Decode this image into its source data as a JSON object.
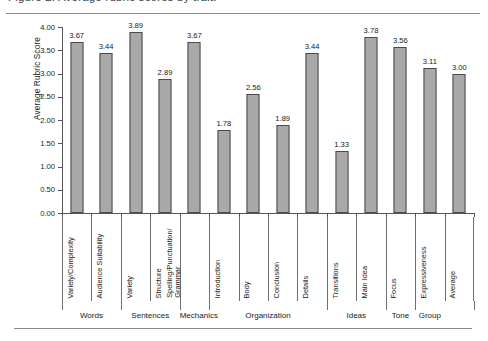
{
  "caption": {
    "text": "Figure 2. Average rubric scores by trait."
  },
  "chart_data": {
    "type": "bar",
    "title": "",
    "xlabel": "",
    "ylabel": "Average Rubric Score",
    "ylim": [
      0,
      4
    ],
    "ytick_labels": [
      "0.00",
      "0.50",
      "1.00",
      "1.50",
      "2.00",
      "2.50",
      "3.00",
      "3.50",
      "4.00"
    ],
    "ytick_values": [
      0,
      0.5,
      1,
      1.5,
      2,
      2.5,
      3,
      3.5,
      4
    ],
    "grid": false,
    "legend": false,
    "bar_color": "#a9a9a9",
    "bar_edge_color": "#4a4a4a",
    "categories": [
      "Variety/Complexity",
      "Audience Suitability",
      "Variety",
      "Structure",
      "Spelling/Punctuation/ Grammar",
      "Introduction",
      "Body",
      "Conclusion",
      "Details",
      "Transitions",
      "Main Idea",
      "Focus",
      "Expressiveness",
      "Average"
    ],
    "values": [
      3.67,
      3.44,
      3.89,
      2.89,
      3.67,
      1.78,
      2.56,
      1.89,
      3.44,
      1.33,
      3.78,
      3.56,
      3.11,
      3.0
    ],
    "value_labels": [
      "3.67",
      "3.44",
      "3.89",
      "2.89",
      "3.67",
      "1.78",
      "2.56",
      "1.89",
      "3.44",
      "1.33",
      "3.78",
      "3.56",
      "3.11",
      "3.00"
    ],
    "groups": [
      {
        "label": "Words",
        "count": 2
      },
      {
        "label": "Sentences",
        "count": 2
      },
      {
        "label": "Mechanics",
        "count": 1
      },
      {
        "label": "Organization",
        "count": 4
      },
      {
        "label": "Ideas",
        "count": 2
      },
      {
        "label": "Tone",
        "count": 1
      },
      {
        "label": "Group",
        "count": 1
      }
    ]
  }
}
